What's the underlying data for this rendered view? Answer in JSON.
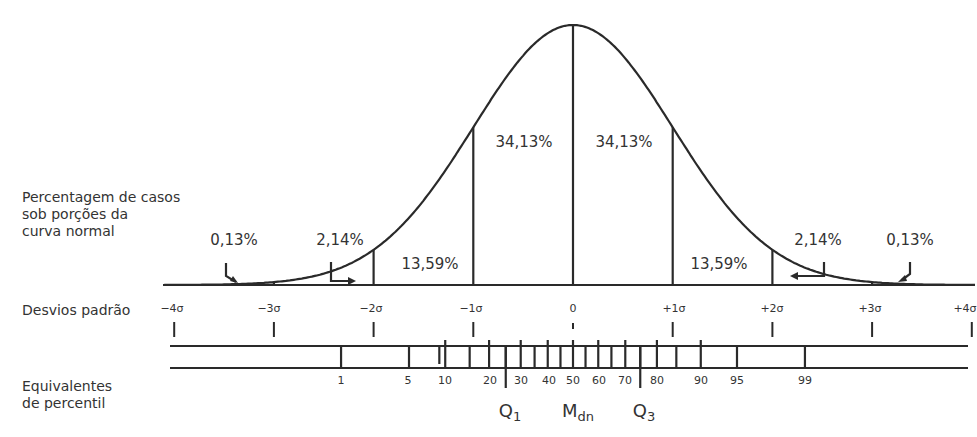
{
  "chart_data": {
    "type": "area",
    "title": "Curva normal",
    "xlabel": "Desvios padrão",
    "x_ticks": [
      "-4σ",
      "-3σ",
      "-2σ",
      "-1σ",
      "0",
      "+1σ",
      "+2σ",
      "+3σ",
      "+4σ"
    ],
    "x_values": [
      -4,
      -3,
      -2,
      -1,
      0,
      1,
      2,
      3,
      4
    ],
    "regions": [
      {
        "from": -4,
        "to": -3,
        "label": "0,13%",
        "value": 0.13
      },
      {
        "from": -3,
        "to": -2,
        "label": "2,14%",
        "value": 2.14
      },
      {
        "from": -2,
        "to": -1,
        "label": "13,59%",
        "value": 13.59
      },
      {
        "from": -1,
        "to": 0,
        "label": "34,13%",
        "value": 34.13
      },
      {
        "from": 0,
        "to": 1,
        "label": "34,13%",
        "value": 34.13
      },
      {
        "from": 1,
        "to": 2,
        "label": "13,59%",
        "value": 13.59
      },
      {
        "from": 2,
        "to": 3,
        "label": "2,14%",
        "value": 2.14
      },
      {
        "from": 3,
        "to": 4,
        "label": "0,13%",
        "value": 0.13
      }
    ],
    "percentile_ticks": [
      1,
      5,
      10,
      20,
      30,
      40,
      50,
      60,
      70,
      80,
      90,
      95,
      99
    ],
    "quartile_markers": [
      {
        "label": "Q1",
        "percentile": 25
      },
      {
        "label": "Mdn",
        "percentile": 50
      },
      {
        "label": "Q3",
        "percentile": 75
      }
    ],
    "grid": false,
    "legend": "none"
  },
  "labels": {
    "percent_cases_line1": "Percentagem de casos",
    "percent_cases_line2": "sob porções da",
    "percent_cases_line3": "curva normal",
    "std_dev": "Desvios padrão",
    "percentile_line1": "Equivalentes",
    "percentile_line2": "de percentil"
  },
  "percentages": {
    "tail_left": "0,13%",
    "p214_left": "2,14%",
    "p1359_left": "13,59%",
    "p3413_left": "34,13%",
    "p3413_right": "34,13%",
    "p1359_right": "13,59%",
    "p214_right": "2,14%",
    "tail_right": "0,13%"
  },
  "sigma_labels": [
    "−4σ",
    "−3σ",
    "−2σ",
    "−1σ",
    "0",
    "+1σ",
    "+2σ",
    "+3σ",
    "+4σ"
  ],
  "percentile_labels": [
    "1",
    "5",
    "10",
    "20",
    "30",
    "40",
    "50",
    "60",
    "70",
    "80",
    "90",
    "95",
    "99"
  ],
  "quartiles": {
    "q1": "Q",
    "q1_sub": "1",
    "mdn": "M",
    "mdn_sub": "dn",
    "q3": "Q",
    "q3_sub": "3"
  },
  "colors": {
    "ink": "#2a2a2a",
    "background": "#ffffff"
  }
}
